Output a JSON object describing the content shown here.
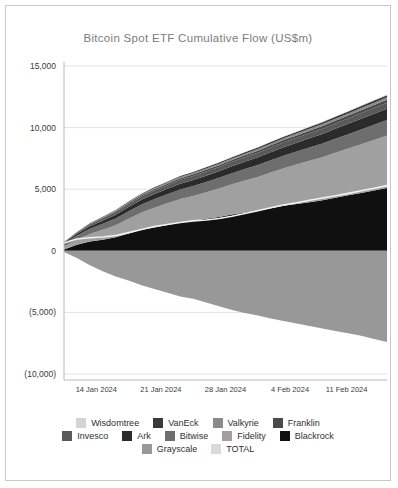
{
  "card": {
    "border_color": "#c8c8c8",
    "background": "#ffffff"
  },
  "chart_data": {
    "type": "area",
    "title": "Bitcoin Spot ETF Cumulative Flow (US$m)",
    "xlabel": "",
    "ylabel": "",
    "ylim": [
      -10000,
      15000
    ],
    "yticks": [
      15000,
      10000,
      5000,
      0,
      -5000,
      -10000
    ],
    "ytick_labels": [
      "15,000",
      "10,000",
      "5,000",
      "0",
      "(5,000)",
      "(10,000)"
    ],
    "grid": true,
    "legend_position": "bottom",
    "stacked": true,
    "x": [
      "11 Jan 2024",
      "12 Jan 2024",
      "16 Jan 2024",
      "17 Jan 2024",
      "18 Jan 2024",
      "19 Jan 2024",
      "22 Jan 2024",
      "23 Jan 2024",
      "24 Jan 2024",
      "25 Jan 2024",
      "26 Jan 2024",
      "29 Jan 2024",
      "30 Jan 2024",
      "31 Jan 2024",
      "1 Feb 2024",
      "2 Feb 2024",
      "5 Feb 2024",
      "6 Feb 2024",
      "7 Feb 2024",
      "8 Feb 2024",
      "9 Feb 2024",
      "12 Feb 2024",
      "13 Feb 2024",
      "14 Feb 2024",
      "15 Feb 2024",
      "16 Feb 2024"
    ],
    "xticks": [
      "14 Jan 2024",
      "21 Jan 2024",
      "28 Jan 2024",
      "4 Feb 2024",
      "11 Feb 2024"
    ],
    "xtick_positions": [
      0.1,
      0.3,
      0.5,
      0.7,
      0.875
    ],
    "series": [
      {
        "name": "Blackrock",
        "color": "#101010",
        "values": [
          110,
          500,
          750,
          900,
          1100,
          1400,
          1700,
          1900,
          2100,
          2300,
          2450,
          2600,
          2750,
          2950,
          3100,
          3250,
          3450,
          3650,
          3800,
          3950,
          4100,
          4300,
          4500,
          4700,
          4900,
          5100
        ]
      },
      {
        "name": "Fidelity",
        "color": "#a0a0a0",
        "values": [
          230,
          420,
          620,
          800,
          980,
          1200,
          1400,
          1600,
          1750,
          1900,
          2000,
          2150,
          2300,
          2450,
          2600,
          2750,
          2900,
          3050,
          3200,
          3350,
          3500,
          3650,
          3800,
          3950,
          4100,
          4250
        ]
      },
      {
        "name": "Bitwise",
        "color": "#6e6e6e",
        "values": [
          240,
          330,
          420,
          490,
          550,
          610,
          660,
          700,
          740,
          780,
          810,
          840,
          870,
          900,
          930,
          960,
          990,
          1020,
          1050,
          1080,
          1110,
          1140,
          1170,
          1200,
          1230,
          1260
        ]
      },
      {
        "name": "Ark",
        "color": "#2b2b2b",
        "values": [
          70,
          130,
          200,
          250,
          300,
          340,
          380,
          410,
          440,
          470,
          490,
          510,
          540,
          570,
          600,
          630,
          660,
          690,
          720,
          750,
          780,
          810,
          840,
          870,
          900,
          930
        ]
      },
      {
        "name": "Invesco",
        "color": "#5a5a5a",
        "values": [
          45,
          90,
          140,
          180,
          215,
          240,
          265,
          285,
          300,
          315,
          325,
          335,
          345,
          355,
          365,
          375,
          385,
          395,
          405,
          415,
          425,
          435,
          445,
          455,
          465,
          475
        ]
      },
      {
        "name": "Franklin",
        "color": "#4a4a4a",
        "values": [
          10,
          25,
          40,
          55,
          70,
          85,
          95,
          105,
          115,
          125,
          130,
          135,
          142,
          150,
          158,
          166,
          174,
          182,
          190,
          198,
          206,
          214,
          222,
          230,
          238,
          246
        ]
      },
      {
        "name": "Valkyrie",
        "color": "#8a8a8a",
        "values": [
          10,
          20,
          32,
          44,
          56,
          66,
          74,
          82,
          90,
          98,
          104,
          110,
          116,
          122,
          128,
          134,
          140,
          146,
          152,
          158,
          164,
          170,
          176,
          182,
          188,
          194
        ]
      },
      {
        "name": "VanEck",
        "color": "#3a3a3a",
        "values": [
          8,
          16,
          26,
          36,
          46,
          54,
          62,
          70,
          76,
          82,
          88,
          94,
          100,
          106,
          112,
          118,
          124,
          130,
          136,
          142,
          148,
          154,
          160,
          166,
          172,
          178
        ]
      },
      {
        "name": "Wisdomtree",
        "color": "#d4d4d4",
        "values": [
          2,
          5,
          8,
          11,
          14,
          17,
          19,
          21,
          23,
          25,
          27,
          29,
          31,
          33,
          35,
          37,
          39,
          41,
          43,
          45,
          47,
          49,
          51,
          53,
          55,
          57
        ]
      },
      {
        "name": "Grayscale",
        "color": "#989898",
        "values": [
          -95,
          -579,
          -1170,
          -1650,
          -2080,
          -2420,
          -2800,
          -3100,
          -3400,
          -3700,
          -3900,
          -4200,
          -4500,
          -4800,
          -5050,
          -5250,
          -5500,
          -5700,
          -5900,
          -6100,
          -6300,
          -6500,
          -6700,
          -6900,
          -7150,
          -7400
        ]
      }
    ],
    "total_line": {
      "name": "TOTAL",
      "color": "#f2f2f2",
      "values": [
        630,
        955,
        1058,
        1115,
        1245,
        1475,
        1736,
        1971,
        2135,
        2295,
        2430,
        2494,
        2622,
        2803,
        3031,
        3250,
        3493,
        3714,
        3906,
        4098,
        4290,
        4463,
        4664,
        4871,
        5078,
        5291
      ]
    }
  },
  "legend": {
    "rows": [
      [
        {
          "label": "Wisdomtree",
          "color": "#d4d4d4"
        },
        {
          "label": "VanEck",
          "color": "#3a3a3a"
        },
        {
          "label": "Valkyrie",
          "color": "#8a8a8a"
        },
        {
          "label": "Franklin",
          "color": "#4a4a4a"
        }
      ],
      [
        {
          "label": "Invesco",
          "color": "#5a5a5a"
        },
        {
          "label": "Ark",
          "color": "#2b2b2b"
        },
        {
          "label": "Bitwise",
          "color": "#6e6e6e"
        },
        {
          "label": "Fidelity",
          "color": "#a0a0a0"
        },
        {
          "label": "Blackrock",
          "color": "#101010"
        }
      ],
      [
        {
          "label": "Grayscale",
          "color": "#989898"
        },
        {
          "label": "TOTAL",
          "color": "#d9d9d9"
        }
      ]
    ]
  }
}
